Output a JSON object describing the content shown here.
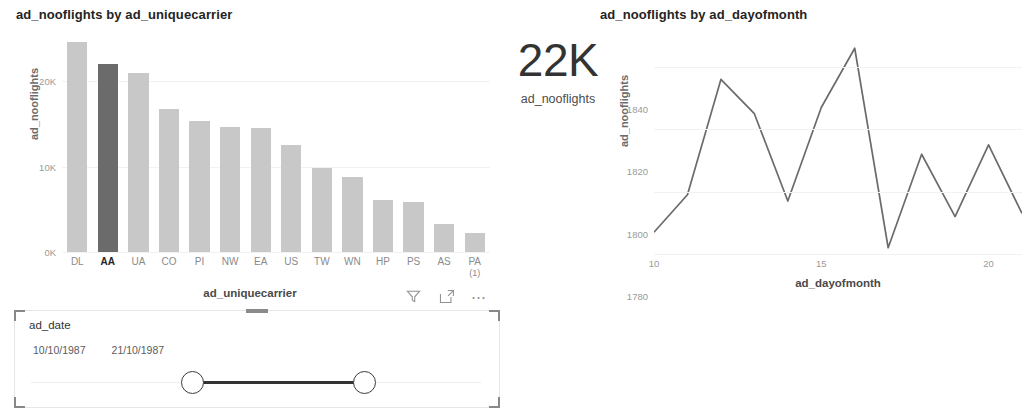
{
  "bar_visual": {
    "title": "ad_nooflights by ad_uniquecarrier",
    "x_axis_title": "ad_uniquecarrier",
    "y_axis_title": "ad_nooflights",
    "toolbar": {
      "filter_icon": "filter-funnel-icon",
      "focus_icon": "focus-mode-icon",
      "more_icon": "more-options-icon"
    }
  },
  "kpi_card": {
    "value": "22K",
    "label": "ad_nooflights"
  },
  "line_visual": {
    "title": "ad_nooflights by ad_dayofmonth",
    "x_axis_title": "ad_dayofmonth",
    "y_axis_title": "ad_nooflights"
  },
  "slicer": {
    "field_label": "ad_date",
    "start_date": "10/10/1987",
    "end_date": "21/10/1987"
  },
  "chart_data": [
    {
      "type": "bar",
      "title": "ad_nooflights by ad_uniquecarrier",
      "xlabel": "ad_uniquecarrier",
      "ylabel": "ad_nooflights",
      "categories": [
        "DL",
        "AA",
        "UA",
        "CO",
        "PI",
        "NW",
        "EA",
        "US",
        "TW",
        "WN",
        "HP",
        "PS",
        "AS",
        "PA"
      ],
      "category_sublabels": [
        "",
        "",
        "",
        "",
        "",
        "",
        "",
        "",
        "",
        "",
        "",
        "",
        "",
        "(1)"
      ],
      "values": [
        24600,
        22000,
        21000,
        16800,
        15300,
        14600,
        14500,
        12500,
        9800,
        8800,
        6100,
        5900,
        3300,
        2200
      ],
      "selected_category": "AA",
      "ylim": [
        0,
        26000
      ],
      "ytick_values": [
        0,
        10000,
        20000
      ],
      "ytick_labels": [
        "0K",
        "10K",
        "20K"
      ],
      "grid": true,
      "legend": "none",
      "bar_color": "#c8c8c8",
      "selected_bar_color": "#6b6b6b"
    },
    {
      "type": "line",
      "title": "ad_nooflights by ad_dayofmonth",
      "xlabel": "ad_dayofmonth",
      "ylabel": "ad_nooflights",
      "x": [
        10,
        11,
        12,
        13,
        14,
        15,
        16,
        17,
        18,
        19,
        20,
        21
      ],
      "values": [
        1787,
        1799,
        1836,
        1825,
        1797,
        1827,
        1846,
        1782,
        1812,
        1792,
        1815,
        1793
      ],
      "xlim": [
        10,
        21
      ],
      "ylim": [
        1780,
        1848
      ],
      "xtick_values": [
        10,
        15,
        20
      ],
      "xtick_labels": [
        "10",
        "15",
        "20"
      ],
      "ytick_values": [
        1780,
        1800,
        1820,
        1840
      ],
      "ytick_labels": [
        "1780",
        "1800",
        "1820",
        "1840"
      ],
      "grid": true,
      "legend": "none",
      "line_color": "#6b6b6b"
    }
  ]
}
